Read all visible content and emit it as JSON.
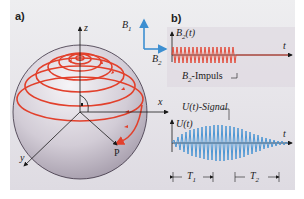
{
  "panel_a": {
    "label": "a)",
    "axes": {
      "z": "z",
      "x": "x",
      "y": "y"
    },
    "point_label": "P",
    "field_legend": {
      "b1": "B",
      "b1_sub": "1",
      "b2": "B",
      "b2_sub": "2"
    }
  },
  "panel_b": {
    "label": "b)",
    "top_plot": {
      "y_label": "B",
      "y_label_sub": "2",
      "y_label_arg": "(t)",
      "x_label": "t",
      "annotation": "-Impuls",
      "annotation_prefix": "B",
      "annotation_sub": "2"
    },
    "bottom_plot": {
      "y_label": "U(t)",
      "x_label": "t",
      "annotation": "U(t)-Signal",
      "interval_1": "T",
      "interval_1_sub": "1",
      "interval_2": "T",
      "interval_2_sub": "2"
    }
  },
  "colors": {
    "spiral": "#e2402c",
    "signal": "#3d8fd1",
    "axis": "#1a1a1a",
    "panel_bg": "#e8e6ea",
    "sphere_light": "#f3f1f4",
    "sphere_dark": "#a89fae"
  }
}
